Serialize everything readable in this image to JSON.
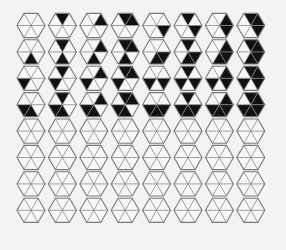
{
  "figure": {
    "rows": 8,
    "cols": 8,
    "triangle_order": [
      "top",
      "upper-right",
      "lower-right",
      "bottom",
      "lower-left",
      "upper-left"
    ],
    "bit_weights": {
      "top": 1,
      "upper-right": 2,
      "lower-right": 4,
      "bottom": 8,
      "lower-left": 16,
      "upper-left": 32
    },
    "filled_rows": 4,
    "colors": {
      "background": "#f3f3f3",
      "fill": "#111111",
      "empty": "#f7f7f7",
      "outline": "#7a7a7a"
    },
    "geometry": {
      "x0": 31,
      "y0": 25.5,
      "dx": 31.4,
      "dy": 26.4,
      "radius": 14
    },
    "cells": [
      [
        [],
        [
          "top"
        ],
        [
          "upper-right"
        ],
        [
          "top",
          "upper-right"
        ],
        [
          "lower-right"
        ],
        [
          "top",
          "lower-right"
        ],
        [
          "upper-right",
          "lower-right"
        ],
        [
          "top",
          "upper-right",
          "lower-right"
        ]
      ],
      [
        [
          "bottom"
        ],
        [
          "top",
          "bottom"
        ],
        [
          "upper-right",
          "bottom"
        ],
        [
          "top",
          "upper-right",
          "bottom"
        ],
        [
          "lower-right",
          "bottom"
        ],
        [
          "top",
          "lower-right",
          "bottom"
        ],
        [
          "upper-right",
          "lower-right",
          "bottom"
        ],
        [
          "top",
          "upper-right",
          "lower-right",
          "bottom"
        ]
      ],
      [
        [
          "lower-left"
        ],
        [
          "top",
          "lower-left"
        ],
        [
          "upper-right",
          "lower-left"
        ],
        [
          "top",
          "upper-right",
          "lower-left"
        ],
        [
          "lower-right",
          "lower-left"
        ],
        [
          "top",
          "lower-right",
          "lower-left"
        ],
        [
          "upper-right",
          "lower-right",
          "lower-left"
        ],
        [
          "top",
          "upper-right",
          "lower-right",
          "lower-left"
        ]
      ],
      [
        [
          "bottom",
          "lower-left"
        ],
        [
          "top",
          "bottom",
          "lower-left"
        ],
        [
          "upper-right",
          "bottom",
          "lower-left"
        ],
        [
          "top",
          "upper-right",
          "bottom",
          "lower-left"
        ],
        [
          "lower-right",
          "bottom",
          "lower-left"
        ],
        [
          "top",
          "lower-right",
          "bottom",
          "lower-left"
        ],
        [
          "upper-right",
          "lower-right",
          "bottom",
          "lower-left"
        ],
        [
          "top",
          "upper-right",
          "lower-right",
          "bottom",
          "lower-left"
        ]
      ],
      [
        [],
        [],
        [],
        [],
        [],
        [],
        [],
        []
      ],
      [
        [],
        [],
        [],
        [],
        [],
        [],
        [],
        []
      ],
      [
        [],
        [],
        [],
        [],
        [],
        [],
        [],
        []
      ],
      [
        [],
        [],
        [],
        [],
        [],
        [],
        [],
        []
      ]
    ]
  }
}
